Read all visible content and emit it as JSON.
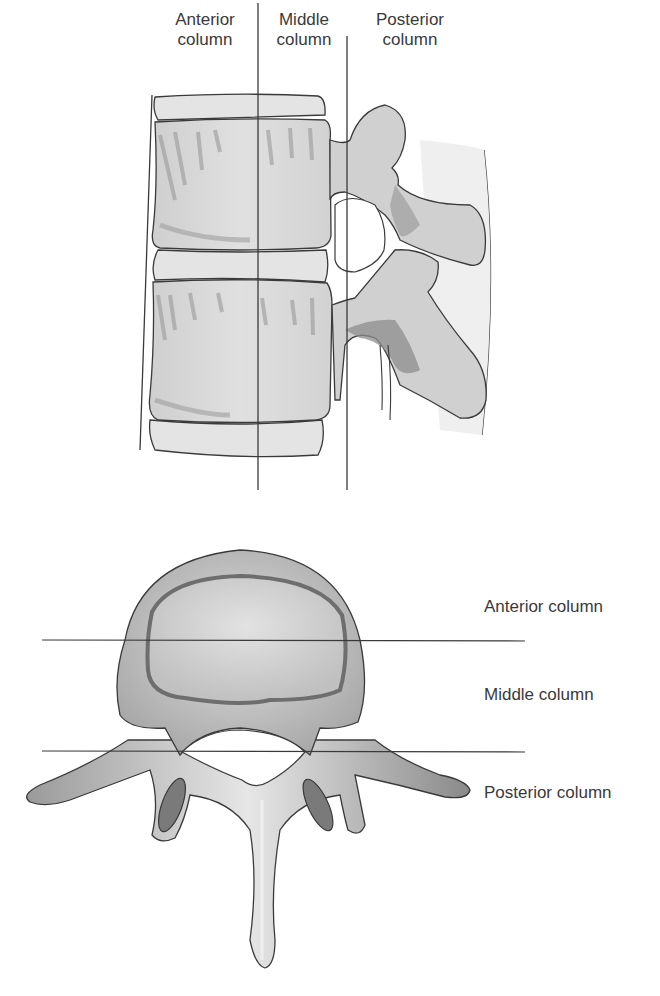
{
  "lateral_view": {
    "labels": [
      {
        "line1": "Anterior",
        "line2": "column"
      },
      {
        "line1": "Middle",
        "line2": "column"
      },
      {
        "line1": "Posterior",
        "line2": "column"
      }
    ]
  },
  "axial_view": {
    "labels": [
      "Anterior column",
      "Middle column",
      "Posterior column"
    ]
  },
  "colors": {
    "bone_light": "#d9d9d9",
    "bone_mid": "#bdbdbd",
    "bone_dark": "#8c8c8c",
    "outline": "#3a3a3a",
    "text": "#3a3a3a"
  }
}
